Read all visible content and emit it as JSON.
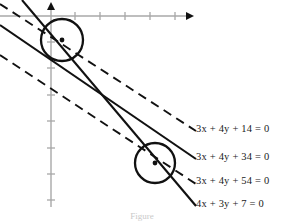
{
  "figure": {
    "type": "geometry-diagram",
    "caption": "Figure",
    "background_color": "#ffffff",
    "ink_color": "#111111",
    "axis_color": "#a8a8a8"
  },
  "axes": {
    "x_axis": {
      "name": "x-axis",
      "y_pixel": 16,
      "x_start": 0,
      "x_end": 194,
      "arrow": "right",
      "ticks_pixels": [
        75,
        100,
        125,
        150,
        175
      ],
      "tick_labels": []
    },
    "y_axis": {
      "name": "y-axis",
      "x_pixel": 51,
      "y_start": 3,
      "y_end": 207,
      "arrow": "up",
      "ticks_pixels": [
        42,
        68,
        95,
        121,
        148,
        174,
        200
      ],
      "tick_labels": []
    },
    "origin_pixels": [
      51,
      16
    ]
  },
  "lines": [
    {
      "id": "line-1",
      "equation": "3x + 4y + 14 = 0",
      "style": "dashed",
      "slope": -0.75,
      "label_index": 0
    },
    {
      "id": "line-2",
      "equation": "3x + 4y + 34 = 0",
      "style": "solid",
      "slope": -0.75,
      "label_index": 1
    },
    {
      "id": "line-3",
      "equation": "3x + 4y + 54 = 0",
      "style": "dashed",
      "slope": -0.75,
      "label_index": 2
    },
    {
      "id": "line-4",
      "equation": "4x + 3y + 7 = 0",
      "style": "solid",
      "slope": -1.333,
      "label_index": 3
    }
  ],
  "labels": [
    {
      "id": "label-eq-1",
      "lhs": "3x + 4y + 14",
      "rhs": "0",
      "text": "3x + 4y + 14 = 0",
      "parts": {
        "a": "3",
        "x": "x",
        "plus1": "+",
        "b": "4",
        "y": "y",
        "plus2": "+",
        "c": "14",
        "eq": "=",
        "z": "0"
      },
      "left_px": 196,
      "top_px": 128
    },
    {
      "id": "label-eq-2",
      "lhs": "3x + 4y + 34",
      "rhs": "0",
      "text": "3x + 4y + 34 = 0",
      "parts": {
        "a": "3",
        "x": "x",
        "plus1": "+",
        "b": "4",
        "y": "y",
        "plus2": "+",
        "c": "34",
        "eq": "=",
        "z": "0"
      },
      "left_px": 196,
      "top_px": 156
    },
    {
      "id": "label-eq-3",
      "lhs": "3x + 4y + 54",
      "rhs": "0",
      "text": "3x + 4y + 54 = 0",
      "parts": {
        "a": "3",
        "x": "x",
        "plus1": "+",
        "b": "4",
        "y": "y",
        "plus2": "+",
        "c": "54",
        "eq": "=",
        "z": "0"
      },
      "left_px": 196,
      "top_px": 180
    },
    {
      "id": "label-eq-4",
      "lhs": "4x + 3y + 7",
      "rhs": "0",
      "text": "4x + 3y + 7 = 0",
      "parts": {
        "a": "4",
        "x": "x",
        "plus1": "+",
        "b": "3",
        "y": "y",
        "plus2": "+",
        "c": "7",
        "eq": "=",
        "z": "0"
      },
      "left_px": 196,
      "top_px": 202
    }
  ],
  "circles": [
    {
      "id": "circle-upper",
      "center_px": [
        62,
        40
      ],
      "radius_px": 21,
      "center_dot": true,
      "stroke_width": 2.2
    },
    {
      "id": "circle-lower",
      "center_px": [
        155,
        163
      ],
      "radius_px": 20,
      "center_dot": true,
      "stroke_width": 2.2
    }
  ]
}
